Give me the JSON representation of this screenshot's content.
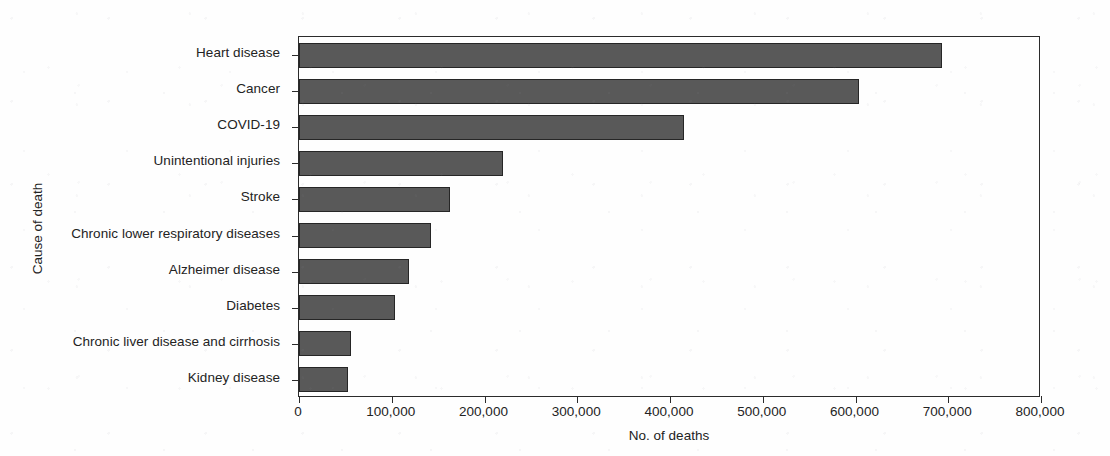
{
  "chart_data": {
    "type": "bar",
    "orientation": "horizontal",
    "title": "",
    "xlabel": "No. of deaths",
    "ylabel": "Cause of death",
    "categories": [
      "Heart disease",
      "Cancer",
      "COVID-19",
      "Unintentional injuries",
      "Stroke",
      "Chronic lower respiratory diseases",
      "Alzheimer disease",
      "Diabetes",
      "Chronic liver disease and cirrhosis",
      "Kidney disease"
    ],
    "values": [
      693000,
      604000,
      415000,
      220000,
      163000,
      142000,
      119000,
      104000,
      56000,
      53000
    ],
    "xlim": [
      0,
      800000
    ],
    "xticks": [
      0,
      100000,
      200000,
      300000,
      400000,
      500000,
      600000,
      700000,
      800000
    ],
    "xtick_labels": [
      "0",
      "100,000",
      "200,000",
      "300,000",
      "400,000",
      "500,000",
      "600,000",
      "700,000",
      "800,000"
    ],
    "grid": false,
    "legend": false,
    "bar_color": "#595959",
    "bar_edge_color": "#262626",
    "axis_color": "#2b2b2b",
    "background_color": "#fefefe"
  }
}
